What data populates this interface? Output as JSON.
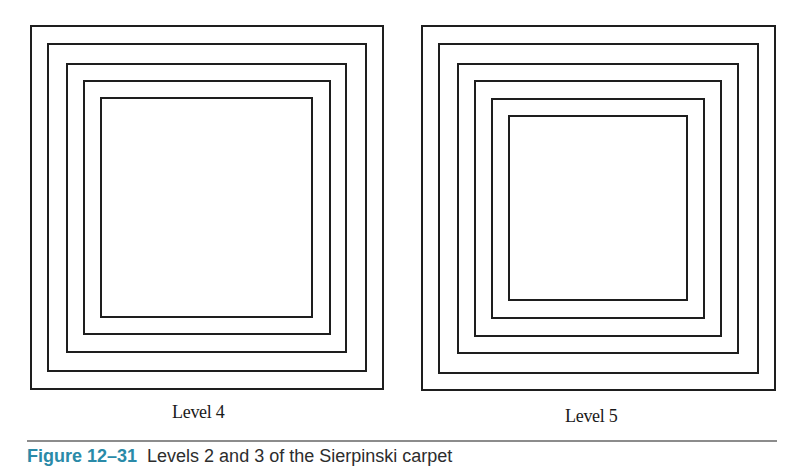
{
  "figure": {
    "panels": [
      {
        "label": "Level 4",
        "squares": [
          {
            "x": 30,
            "y": 25,
            "w": 354,
            "h": 365
          },
          {
            "x": 47,
            "y": 43,
            "w": 320,
            "h": 329
          },
          {
            "x": 66,
            "y": 63,
            "w": 281,
            "h": 290
          },
          {
            "x": 83,
            "y": 80,
            "w": 248,
            "h": 255
          },
          {
            "x": 100,
            "y": 97,
            "w": 213,
            "h": 221
          }
        ]
      },
      {
        "label": "Level 5",
        "squares": [
          {
            "x": 421,
            "y": 25,
            "w": 355,
            "h": 366
          },
          {
            "x": 438,
            "y": 43,
            "w": 321,
            "h": 331
          },
          {
            "x": 457,
            "y": 63,
            "w": 282,
            "h": 291
          },
          {
            "x": 474,
            "y": 80,
            "w": 248,
            "h": 257
          },
          {
            "x": 491,
            "y": 98,
            "w": 214,
            "h": 221
          },
          {
            "x": 508,
            "y": 115,
            "w": 180,
            "h": 186
          }
        ]
      }
    ],
    "line_color": "#1e1e1e"
  },
  "labels": {
    "left": "Level 4",
    "right": "Level 5"
  },
  "caption": {
    "number": "Figure 12–31",
    "text": "Levels 2 and 3 of the Sierpinski carpet",
    "number_color": "#2a8aa8"
  }
}
